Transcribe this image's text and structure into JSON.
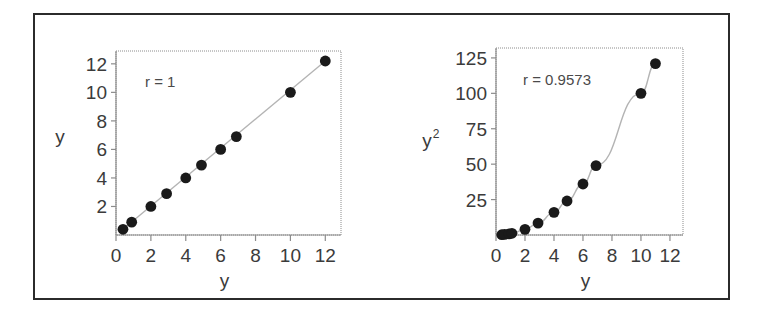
{
  "figure": {
    "background_color": "#ffffff",
    "frame_color": "#2b2b2b",
    "point_color": "#1a1a1a",
    "line_color": "#b4b4b4",
    "axis_color": "#8c8c8c",
    "text_color": "#3b3b3b"
  },
  "chart_data": [
    {
      "type": "scatter",
      "panel": "left",
      "title": "",
      "xlabel": "y",
      "ylabel": "y",
      "annotation": "r = 1",
      "annotation_value": 1,
      "grid": false,
      "legend": "none",
      "xlim": [
        0,
        12.9
      ],
      "ylim": [
        0,
        12.9
      ],
      "xticks": [
        0,
        2,
        4,
        6,
        8,
        10,
        12
      ],
      "xticklabels": [
        "0",
        "2",
        "4",
        "6",
        "8",
        "10",
        "12"
      ],
      "yticks": [
        2,
        4,
        6,
        8,
        10,
        12
      ],
      "yticklabels": [
        "2",
        "4",
        "6",
        "8",
        "10",
        "12"
      ],
      "x": [
        0.4,
        0.9,
        2.0,
        2.9,
        4.0,
        4.9,
        6.0,
        6.9,
        10.0,
        12.0
      ],
      "y": [
        0.4,
        0.9,
        2.0,
        2.9,
        4.0,
        4.9,
        6.0,
        6.9,
        10.0,
        12.2
      ],
      "fit_line": {
        "from": [
          0.4,
          0.4
        ],
        "to": [
          12.0,
          12.2
        ]
      }
    },
    {
      "type": "scatter",
      "panel": "right",
      "title": "",
      "xlabel": "y",
      "ylabel": "y²",
      "ylabel_base": "y",
      "ylabel_sup": "2",
      "annotation": "r = 0.9573",
      "annotation_value": 0.9573,
      "grid": false,
      "legend": "none",
      "xlim": [
        0,
        12.9
      ],
      "ylim": [
        0,
        132
      ],
      "xticks": [
        0,
        2,
        4,
        6,
        8,
        10,
        12
      ],
      "xticklabels": [
        "0",
        "2",
        "4",
        "6",
        "8",
        "10",
        "12"
      ],
      "yticks": [
        25,
        50,
        75,
        100,
        125
      ],
      "yticklabels": [
        "25",
        "50",
        "75",
        "100",
        "125"
      ],
      "x": [
        0.4,
        0.6,
        0.9,
        1.1,
        2.0,
        2.9,
        4.0,
        4.9,
        6.0,
        6.9,
        10.0,
        11.0
      ],
      "y": [
        0.2,
        0.4,
        0.8,
        1.2,
        4.0,
        8.4,
        16.0,
        24.0,
        36.0,
        49.0,
        100.0,
        121.0
      ],
      "fit_curve_note": "smooth quadratic through points"
    }
  ]
}
